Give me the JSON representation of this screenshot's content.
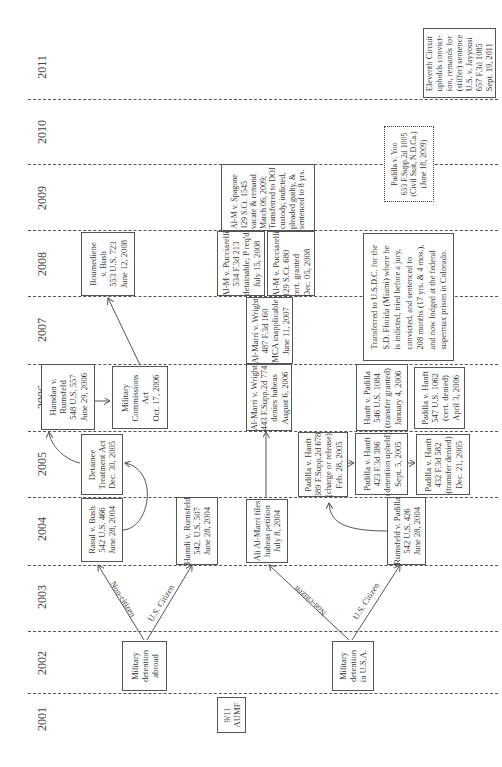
{
  "diagram": {
    "orientation": "rotated 90 degrees counter-clockwise; time runs bottom to top",
    "years": [
      "2001",
      "2002",
      "2003",
      "2004",
      "2005",
      "2006",
      "2007",
      "2008",
      "2009",
      "2010",
      "2011"
    ],
    "branches": {
      "abroad_noncitizen": "Non-citizen",
      "abroad_citizen": "U.S. Citizen",
      "usa_noncitizen": "Non-citizen",
      "usa_citizen": "U.S. Citizen"
    },
    "boxes": {
      "aumf": [
        "9/11",
        "AUMF"
      ],
      "detention_abroad": [
        "Military",
        "detention",
        "abroad"
      ],
      "detention_usa": [
        "Military",
        "detention",
        "in U.S.A."
      ],
      "rasul": [
        "Rasul v. Bush",
        "542 U.S. 466",
        "June 28, 2004"
      ],
      "hamdi": [
        "Hamdi v. Rumsfeld",
        "542. U.S. 507",
        "June 28, 2004"
      ],
      "almarri_files": [
        "Ali Al-Marri files",
        "habeas petition",
        "July 8, 2004"
      ],
      "rumsfeld_padilla": [
        "Rumsfeld v. Padilla",
        "542 U.S. 426",
        "June 28, 2004"
      ],
      "dta": [
        "Detainee",
        "Treatment Act",
        "Dec. 30, 2005"
      ],
      "padilla_hanft_2005a": [
        "Padilla v. Hanft",
        "389 F.Supp.2d 678",
        "(charge or release)",
        "Feb. 28, 2005"
      ],
      "padilla_hanft_2005b": [
        "Padilla v. Hanft",
        "423 F.3d 386",
        "(detention upheld)",
        "Sept. 5, 2005"
      ],
      "padilla_hanft_2005c": [
        "Padilla v. Hanft",
        "432 F.3d 582",
        "(transfer denied)",
        "Dec. 21, 2005"
      ],
      "hamdan": [
        "Hamdan v.",
        "Rumsfeld",
        "548 U.S. 557",
        "June 29, 2006"
      ],
      "mca": [
        "Military",
        "Commissions",
        "Act",
        "Oct. 17, 2006"
      ],
      "almarri_wright_2006": [
        "Al-Marri v. Wright",
        "443 F.Supp.2d 774",
        "denies habeas",
        "August 6, 2006"
      ],
      "hanft_padilla_2006": [
        "Hanft v. Padilla",
        "546 U.S. 1084",
        "(transfer granted)",
        "January 4, 2006"
      ],
      "padilla_hanft_2006": [
        "Padilla v. Hanft",
        "547 U.S. 1062",
        "(cert. denied)",
        "April 3, 2006"
      ],
      "almarri_wright_2007": [
        "Al-Marri v. Wright",
        "487 F.3d 160",
        "MCA inapplicable",
        "June 11, 2007"
      ],
      "boumediene": [
        "Boumediene",
        "v. Bush",
        "553 U.S. 723",
        "June 12, 2008"
      ],
      "pucciarelli_a": [
        "Al-M v. Pucciarelli",
        "534 F.3d 213",
        "detainable; P req'd",
        "July 15, 2008"
      ],
      "pucciarelli_b": [
        "Al-M v. Pucciarelli",
        "129 S.Ct. 680",
        "cert. granted",
        "Dec. 05, 2008"
      ],
      "spagone": [
        "Al-M v. Spagone",
        "129 S.Ct. 1545",
        "vacate & remand",
        "March 06, 2009;",
        "Transferred to DOJ",
        "custody, indicted,",
        "pleaded guilty, &",
        "sentenced to 8 yrs."
      ],
      "transferred_usdc": [
        "Transferred to U.S.D.C. for the",
        "S.D. Florida (Miami) where he",
        "is indicted, tried before a jury,",
        "convicted, and sentenced to",
        "208 months (17 yrs. & 4 mos.),",
        "and now lodged at the federal",
        "supermax prison in Colorado."
      ],
      "padilla_yoo": [
        "Padilla v. Yoo",
        "633 F.Supp.2d 1005",
        "(Civil Suit, N.D.Ca.)",
        "(June 18, 2009)"
      ],
      "eleventh_circuit": [
        "Eleventh Circuit",
        "upholds convict-",
        "ion, remands for",
        "(stiffer) sentence",
        "U.S. v. Jayyousi",
        "657 F.3d 1085",
        "Sept. 19, 2011"
      ]
    }
  }
}
